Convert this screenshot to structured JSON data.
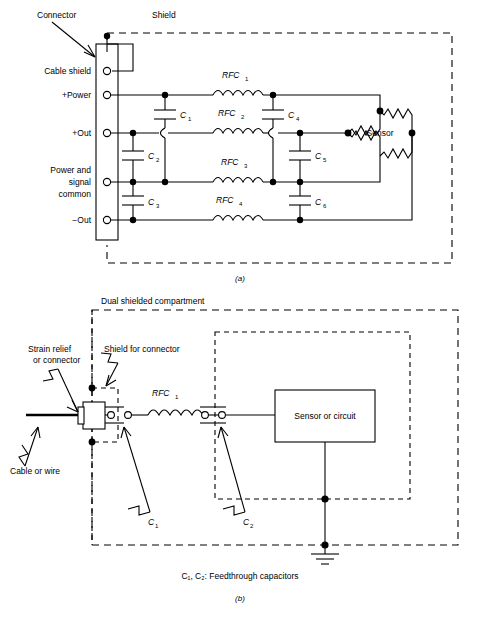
{
  "figure": {
    "title_a": "(a)",
    "title_b": "(b)",
    "footnote_b": "C₁, C₂: Feedthrough capacitors"
  },
  "diagram_a": {
    "shield_label": "Shield",
    "connector_label": "Connector",
    "pins": [
      {
        "label": "Cable shield"
      },
      {
        "label": "+Power"
      },
      {
        "label": "+Out"
      },
      {
        "label": "Power and",
        "label2": "signal",
        "label3": "common"
      },
      {
        "label": "−Out"
      }
    ],
    "inductors": [
      {
        "name": "RFC",
        "sub": "1"
      },
      {
        "name": "RFC",
        "sub": "2"
      },
      {
        "name": "RFC",
        "sub": "3"
      },
      {
        "name": "RFC",
        "sub": "4"
      }
    ],
    "capacitors": [
      {
        "name": "C",
        "sub": "1"
      },
      {
        "name": "C",
        "sub": "2"
      },
      {
        "name": "C",
        "sub": "3"
      },
      {
        "name": "C",
        "sub": "4"
      },
      {
        "name": "C",
        "sub": "5"
      },
      {
        "name": "C",
        "sub": "6"
      }
    ],
    "sensor_label": "Sensor"
  },
  "diagram_b": {
    "compartment_label": "Dual shielded compartment",
    "strain_relief_label": "Strain relief",
    "strain_relief_label2": "or connector",
    "shield_connector_label": "Shield for connector",
    "cable_label": "Cable or wire",
    "inductor": {
      "name": "RFC",
      "sub": "1"
    },
    "capacitors": [
      {
        "name": "C",
        "sub": "1"
      },
      {
        "name": "C",
        "sub": "2"
      }
    ],
    "block_label": "Sensor or circuit",
    "ground_icon": "earth-ground-icon"
  },
  "colors": {
    "ink": "#000000",
    "paper": "#ffffff"
  }
}
